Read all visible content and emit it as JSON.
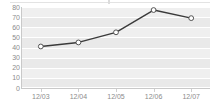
{
  "chart_data": {
    "type": "line",
    "title": "",
    "subtitle": "",
    "xlabel": "",
    "ylabel": "",
    "categories": [
      "12/03",
      "12/04",
      "12/05",
      "12/06",
      "12/07"
    ],
    "values": [
      41,
      45,
      55,
      77,
      69
    ],
    "series": [
      {
        "name": "series-1",
        "values": [
          41,
          45,
          55,
          77,
          69
        ]
      }
    ],
    "ylim": [
      0,
      80
    ],
    "yticks": [
      0,
      10,
      20,
      30,
      40,
      50,
      60,
      70,
      80
    ],
    "ytick_labels": [
      "0",
      "10",
      "20",
      "30",
      "40",
      "50",
      "60",
      "70",
      "80"
    ],
    "xtick_labels": [
      "12/03",
      "12/04",
      "12/05",
      "12/06",
      "12/07"
    ],
    "grid": true,
    "legend": false,
    "legend_position": "none",
    "annotations": [],
    "colors": {
      "line": "#3a3a3a",
      "marker_fill": "#ffffff",
      "marker_stroke": "#555555",
      "plot_band": "#e9e9e9",
      "gridline": "#ffffff",
      "axis": "#c9c9c9",
      "tick_text": "#8c8c8c",
      "background": "#ffffff"
    },
    "marker": "circle",
    "line_width": 1.4
  }
}
